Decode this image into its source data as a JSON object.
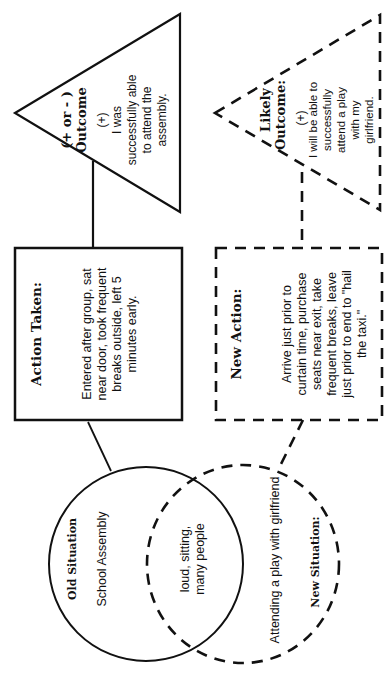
{
  "diagram": {
    "type": "flow-diagram-rotated",
    "orientation": "rotated 90deg counter-clockwise",
    "colors": {
      "stroke": "#111111",
      "background": "#ffffff"
    },
    "old_path": {
      "situation": {
        "shape": "circle-solid",
        "title": "Old Situation",
        "text": "School Assembly"
      },
      "overlap": {
        "text_line1": "loud, sitting,",
        "text_line2": "many people"
      },
      "action": {
        "shape": "box-solid",
        "title": "Action Taken:",
        "lines": [
          "Entered after group, sat",
          "near door, took frequent",
          "breaks outside, left 5",
          "minutes early."
        ]
      },
      "outcome": {
        "shape": "triangle-solid",
        "title_line1": "(+ or - )",
        "title_line2": "Outcome",
        "sign": "(+)",
        "lines": [
          "I was",
          "successfully able",
          "to attend the",
          "assembly."
        ]
      }
    },
    "new_path": {
      "situation": {
        "shape": "circle-dashed",
        "title": "New Situation:",
        "text": "Attending a play with girlfriend"
      },
      "action": {
        "shape": "box-dashed",
        "title": "New Action:",
        "lines": [
          "Arrive just prior to",
          "curtain time, purchase",
          "seats near exit, take",
          "frequent breaks, leave",
          "just prior to end to \"hail",
          "the taxi.\""
        ]
      },
      "outcome": {
        "shape": "triangle-dashed",
        "title_line1": "Likely",
        "title_line2": "Outcome:",
        "sign": "(+)",
        "lines": [
          "I will be able to",
          "successfully",
          "attend a play",
          "with my",
          "girlfriend."
        ]
      }
    }
  }
}
